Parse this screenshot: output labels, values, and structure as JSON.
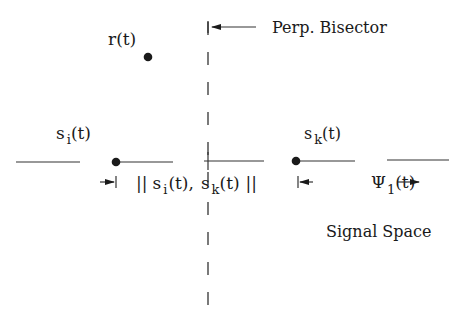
{
  "diagram": {
    "title": "Signal Space",
    "bisector_label": "Perp. Bisector",
    "received": {
      "label": "r",
      "arg": "(t)"
    },
    "signal_i": {
      "label": "s",
      "sub": "i",
      "arg": "(t)"
    },
    "signal_k": {
      "label": "s",
      "sub": "k",
      "arg": "(t)"
    },
    "distance": {
      "open": "||",
      "s1": "s",
      "s1_sub": "i",
      "s1_arg": "(t),",
      "s2": "s",
      "s2_sub": "k",
      "s2_arg": "(t)",
      "close": "||"
    },
    "basis": {
      "label": "Ψ",
      "sub": "1",
      "arg": "(t)"
    },
    "colors": {
      "ink": "#1a1a1a",
      "background": "#ffffff"
    }
  }
}
